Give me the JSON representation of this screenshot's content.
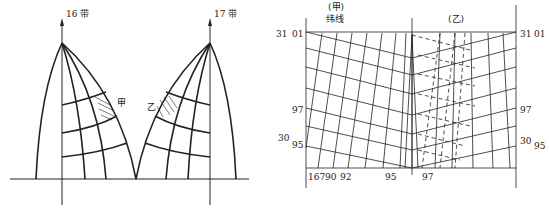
{
  "left_figure": {
    "zone_left_label": "16 带",
    "zone_right_label": "17 带",
    "region_a_label": "甲",
    "region_b_label": "乙"
  },
  "right_figure": {
    "header_a_line1": "(甲)",
    "header_a_line2": "纬线",
    "header_b": "(乙)",
    "left_side_labels": {
      "top_outer": "31",
      "top_inner": "01",
      "mid": "97",
      "low_outer": "30",
      "low_inner": "95"
    },
    "right_side_labels": {
      "top_outer": "31",
      "top_inner": "01",
      "mid": "97",
      "low_outer": "30",
      "low_inner": "95"
    },
    "bottom_labels": [
      "167",
      "90",
      "92",
      "95",
      "97"
    ]
  },
  "colors": {
    "line": "#222222",
    "background": "#ffffff"
  }
}
